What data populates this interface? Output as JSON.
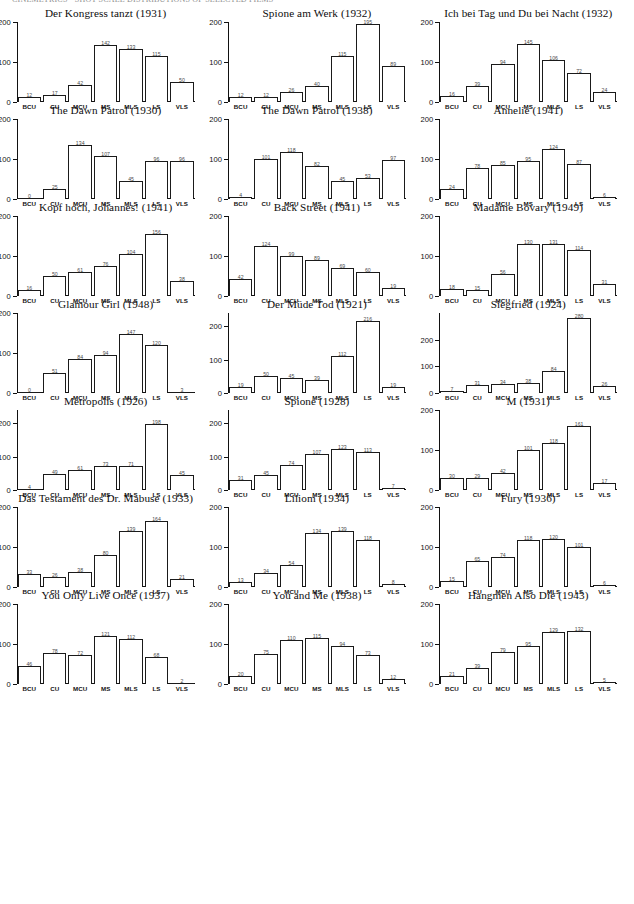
{
  "page": {
    "top_cut_text": "CINEMETRICS · SHOT SCALE DISTRIBUTIONS OF SELECTED FILMS",
    "categories": [
      "BCU",
      "CU",
      "MCU",
      "MS",
      "MLS",
      "LS",
      "VLS"
    ]
  },
  "chart_data": [
    {
      "type": "bar",
      "title": "Der Kongress tanzt (1931)",
      "categories": [
        "BCU",
        "CU",
        "MCU",
        "MS",
        "MLS",
        "LS",
        "VLS"
      ],
      "values": [
        12,
        17,
        42,
        142,
        133,
        115,
        50
      ],
      "xlabel": "",
      "ylabel": "",
      "ylim": [
        0,
        200
      ],
      "yticks": [
        0,
        100,
        200
      ],
      "grid": false,
      "legend": "none"
    },
    {
      "type": "bar",
      "title": "Spione am Werk (1932)",
      "categories": [
        "BCU",
        "CU",
        "MCU",
        "MS",
        "MLS",
        "LS",
        "VLS"
      ],
      "values": [
        12,
        12,
        26,
        40,
        115,
        195,
        89
      ],
      "xlabel": "",
      "ylabel": "",
      "ylim": [
        0,
        200
      ],
      "yticks": [
        0,
        100,
        200
      ],
      "grid": false,
      "legend": "none"
    },
    {
      "type": "bar",
      "title": "Ich bei Tag und Du bei Nacht (1932)",
      "categories": [
        "BCU",
        "CU",
        "MCU",
        "MS",
        "MLS",
        "LS",
        "VLS"
      ],
      "values": [
        16,
        39,
        94,
        145,
        106,
        72,
        24
      ],
      "xlabel": "",
      "ylabel": "",
      "ylim": [
        0,
        200
      ],
      "yticks": [
        0,
        100,
        200
      ],
      "grid": false,
      "legend": "none"
    },
    {
      "type": "bar",
      "title": "The Dawn Patrol (1930)",
      "categories": [
        "BCU",
        "CU",
        "MCU",
        "MS",
        "MLS",
        "LS",
        "VLS"
      ],
      "values": [
        0,
        25,
        134,
        107,
        45,
        96,
        96
      ],
      "xlabel": "",
      "ylabel": "",
      "ylim": [
        0,
        200
      ],
      "yticks": [
        0,
        100,
        200
      ],
      "grid": false,
      "legend": "none"
    },
    {
      "type": "bar",
      "title": "The Dawn Patrol (1938)",
      "categories": [
        "BCU",
        "CU",
        "MCU",
        "MS",
        "MLS",
        "LS",
        "VLS"
      ],
      "values": [
        4,
        101,
        118,
        82,
        45,
        53,
        97
      ],
      "xlabel": "",
      "ylabel": "",
      "ylim": [
        0,
        200
      ],
      "yticks": [
        0,
        100,
        200
      ],
      "grid": false,
      "legend": "none"
    },
    {
      "type": "bar",
      "title": "Annelie (1941)",
      "categories": [
        "BCU",
        "CU",
        "MCU",
        "MS",
        "MLS",
        "LS",
        "VLS"
      ],
      "values": [
        24,
        78,
        85,
        95,
        124,
        87,
        6
      ],
      "xlabel": "",
      "ylabel": "",
      "ylim": [
        0,
        200
      ],
      "yticks": [
        0,
        100,
        200
      ],
      "grid": false,
      "legend": "none"
    },
    {
      "type": "bar",
      "title": "Kopf hoch, Johannes! (1941)",
      "categories": [
        "BCU",
        "CU",
        "MCU",
        "MS",
        "MLS",
        "LS",
        "VLS"
      ],
      "values": [
        16,
        50,
        61,
        76,
        104,
        156,
        38
      ],
      "xlabel": "",
      "ylabel": "",
      "ylim": [
        0,
        200
      ],
      "yticks": [
        0,
        100,
        200
      ],
      "grid": false,
      "legend": "none"
    },
    {
      "type": "bar",
      "title": "Back Street (1941)",
      "categories": [
        "BCU",
        "CU",
        "MCU",
        "MS",
        "MLS",
        "LS",
        "VLS"
      ],
      "values": [
        42,
        124,
        99,
        89,
        69,
        60,
        19
      ],
      "xlabel": "",
      "ylabel": "",
      "ylim": [
        0,
        200
      ],
      "yticks": [
        0,
        100,
        200
      ],
      "grid": false,
      "legend": "none"
    },
    {
      "type": "bar",
      "title": "Madame Bovary (1949)",
      "categories": [
        "BCU",
        "CU",
        "MCU",
        "MS",
        "MLS",
        "LS",
        "VLS"
      ],
      "values": [
        18,
        15,
        56,
        130,
        131,
        114,
        31
      ],
      "xlabel": "",
      "ylabel": "",
      "ylim": [
        0,
        200
      ],
      "yticks": [
        0,
        100,
        200
      ],
      "grid": false,
      "legend": "none"
    },
    {
      "type": "bar",
      "title": "Glamour Girl (1948)",
      "categories": [
        "BCU",
        "CU",
        "MCU",
        "MS",
        "MLS",
        "LS",
        "VLS"
      ],
      "values": [
        0,
        51,
        84,
        94,
        147,
        120,
        3
      ],
      "xlabel": "",
      "ylabel": "",
      "ylim": [
        0,
        200
      ],
      "yticks": [
        0,
        100,
        200
      ],
      "grid": false,
      "legend": "none"
    },
    {
      "type": "bar",
      "title": "Der Müde Tod (1921)",
      "categories": [
        "BCU",
        "CU",
        "MCU",
        "MS",
        "MLS",
        "LS",
        "VLS"
      ],
      "values": [
        19,
        50,
        45,
        39,
        112,
        216,
        19
      ],
      "xlabel": "",
      "ylabel": "",
      "ylim": [
        0,
        240
      ],
      "yticks": [
        0,
        100,
        200
      ],
      "grid": false,
      "legend": "none"
    },
    {
      "type": "bar",
      "title": "Siegfried (1924)",
      "categories": [
        "BCU",
        "CU",
        "MCU",
        "MS",
        "MLS",
        "LS",
        "VLS"
      ],
      "values": [
        7,
        31,
        34,
        38,
        84,
        280,
        26
      ],
      "xlabel": "",
      "ylabel": "",
      "ylim": [
        0,
        300
      ],
      "yticks": [
        0,
        100,
        200
      ],
      "grid": false,
      "legend": "none"
    },
    {
      "type": "bar",
      "title": "Metropolis (1926)",
      "categories": [
        "BCU",
        "CU",
        "MCU",
        "MS",
        "MLS",
        "LS",
        "VLS"
      ],
      "values": [
        4,
        49,
        61,
        73,
        71,
        198,
        45
      ],
      "xlabel": "",
      "ylabel": "",
      "ylim": [
        0,
        240
      ],
      "yticks": [
        0,
        100,
        200
      ],
      "grid": false,
      "legend": "none"
    },
    {
      "type": "bar",
      "title": "Spione (1928)",
      "categories": [
        "BCU",
        "CU",
        "MCU",
        "MS",
        "MLS",
        "LS",
        "VLS"
      ],
      "values": [
        31,
        45,
        74,
        107,
        123,
        113,
        7
      ],
      "xlabel": "",
      "ylabel": "",
      "ylim": [
        0,
        240
      ],
      "yticks": [
        0,
        100,
        200
      ],
      "grid": false,
      "legend": "none"
    },
    {
      "type": "bar",
      "title": "M (1931)",
      "categories": [
        "BCU",
        "CU",
        "MCU",
        "MS",
        "MLS",
        "LS",
        "VLS"
      ],
      "values": [
        30,
        29,
        42,
        101,
        118,
        161,
        17
      ],
      "xlabel": "",
      "ylabel": "",
      "ylim": [
        0,
        200
      ],
      "yticks": [
        0,
        100,
        200
      ],
      "grid": false,
      "legend": "none"
    },
    {
      "type": "bar",
      "title": "Das Testament des Dr. Mabuse (1933)",
      "categories": [
        "BCU",
        "CU",
        "MCU",
        "MS",
        "MLS",
        "LS",
        "VLS"
      ],
      "values": [
        33,
        26,
        38,
        80,
        139,
        164,
        21
      ],
      "xlabel": "",
      "ylabel": "",
      "ylim": [
        0,
        200
      ],
      "yticks": [
        0,
        100,
        200
      ],
      "grid": false,
      "legend": "none"
    },
    {
      "type": "bar",
      "title": "Liliom (1934)",
      "categories": [
        "BCU",
        "CU",
        "MCU",
        "MS",
        "MLS",
        "LS",
        "VLS"
      ],
      "values": [
        13,
        34,
        54,
        134,
        139,
        118,
        8
      ],
      "xlabel": "",
      "ylabel": "",
      "ylim": [
        0,
        200
      ],
      "yticks": [
        0,
        100,
        200
      ],
      "grid": false,
      "legend": "none"
    },
    {
      "type": "bar",
      "title": "Fury (1936)",
      "categories": [
        "BCU",
        "CU",
        "MCU",
        "MS",
        "MLS",
        "LS",
        "VLS"
      ],
      "values": [
        15,
        65,
        74,
        118,
        120,
        101,
        6
      ],
      "xlabel": "",
      "ylabel": "",
      "ylim": [
        0,
        200
      ],
      "yticks": [
        0,
        100,
        200
      ],
      "grid": false,
      "legend": "none"
    },
    {
      "type": "bar",
      "title": "You Only Live Once (1937)",
      "categories": [
        "BCU",
        "CU",
        "MCU",
        "MS",
        "MLS",
        "LS",
        "VLS"
      ],
      "values": [
        46,
        78,
        72,
        121,
        112,
        68,
        2
      ],
      "xlabel": "",
      "ylabel": "",
      "ylim": [
        0,
        200
      ],
      "yticks": [
        0,
        100,
        200
      ],
      "grid": false,
      "legend": "none"
    },
    {
      "type": "bar",
      "title": "You and Me (1938)",
      "categories": [
        "BCU",
        "CU",
        "MCU",
        "MS",
        "MLS",
        "LS",
        "VLS"
      ],
      "values": [
        20,
        75,
        110,
        115,
        94,
        73,
        12
      ],
      "xlabel": "",
      "ylabel": "",
      "ylim": [
        0,
        200
      ],
      "yticks": [
        0,
        100,
        200
      ],
      "grid": false,
      "legend": "none"
    },
    {
      "type": "bar",
      "title": "Hangmen Also Die (1943)",
      "categories": [
        "BCU",
        "CU",
        "MCU",
        "MS",
        "MLS",
        "LS",
        "VLS"
      ],
      "values": [
        21,
        39,
        79,
        95,
        129,
        132,
        5
      ],
      "xlabel": "",
      "ylabel": "",
      "ylim": [
        0,
        200
      ],
      "yticks": [
        0,
        100,
        200
      ],
      "grid": false,
      "legend": "none"
    }
  ]
}
